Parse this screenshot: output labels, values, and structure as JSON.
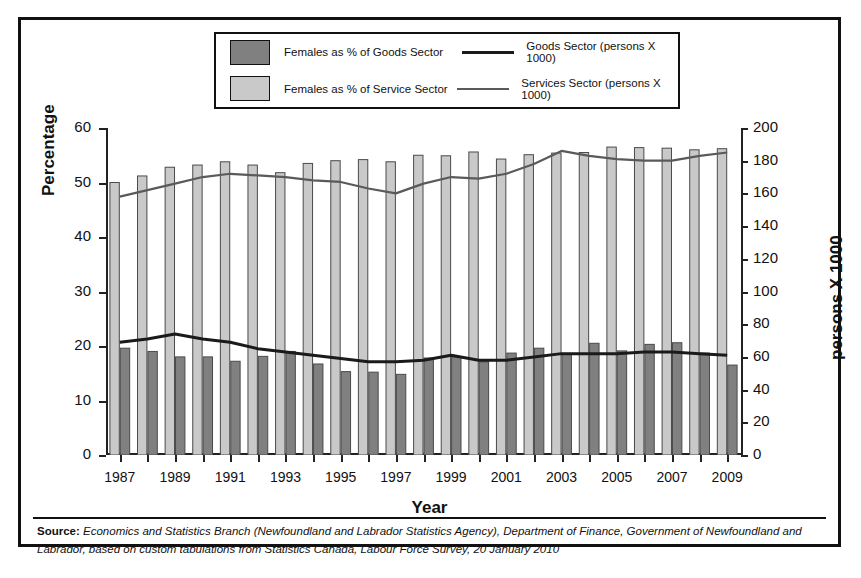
{
  "legend": {
    "items": [
      {
        "type": "swatch",
        "name": "goods-bar-swatch",
        "color": "#808080",
        "label": "Females as % of Goods Sector"
      },
      {
        "type": "line",
        "name": "goods-line-swatch",
        "color": "#1a1a1a",
        "width": 3,
        "label": "Goods Sector (persons X 1000)"
      },
      {
        "type": "swatch",
        "name": "service-bar-swatch",
        "color": "#c9c9c9",
        "label": "Females as % of Service Sector"
      },
      {
        "type": "line",
        "name": "service-line-swatch",
        "color": "#5a5a5a",
        "width": 2,
        "label": "Services Sector (persons X 1000)"
      }
    ]
  },
  "axes": {
    "y_left_title": "Percentage",
    "y_right_title": "persons X 1000",
    "x_title": "Year",
    "y_left_ticks": [
      "0",
      "10",
      "20",
      "30",
      "40",
      "50",
      "60"
    ],
    "y_right_ticks": [
      "0",
      "20",
      "40",
      "60",
      "80",
      "100",
      "120",
      "140",
      "160",
      "180",
      "200"
    ],
    "x_ticks": [
      "1987",
      "",
      "1989",
      "",
      "1991",
      "",
      "1993",
      "",
      "1995",
      "",
      "1997",
      "",
      "1999",
      "",
      "2001",
      "",
      "2003",
      "",
      "2005",
      "",
      "2007",
      "",
      "2009"
    ]
  },
  "source": {
    "prefix": "Source:",
    "text": " Economics and Statistics Branch (Newfoundland and Labrador Statistics Agency), Department of Finance, Government of Newfoundland and Labrador, based on custom tabulations from Statistics Canada, Labour Force Survey, 20 January 2010"
  },
  "chart_data": {
    "type": "bar",
    "title": "",
    "xlabel": "Year",
    "ylabel": "Percentage",
    "y2label": "persons X 1000",
    "ylim": [
      0,
      60
    ],
    "y2lim": [
      0,
      200
    ],
    "grid": false,
    "legend_position": "top",
    "categories": [
      1987,
      1988,
      1989,
      1990,
      1991,
      1992,
      1993,
      1994,
      1995,
      1996,
      1997,
      1998,
      1999,
      2000,
      2001,
      2002,
      2003,
      2004,
      2005,
      2006,
      2007,
      2008,
      2009
    ],
    "series": [
      {
        "name": "Females as % of Service Sector",
        "type": "bar",
        "axis": "left",
        "color": "#c9c9c9",
        "values": [
          50.0,
          51.2,
          52.8,
          53.2,
          53.8,
          53.2,
          51.8,
          53.5,
          54.0,
          54.2,
          53.8,
          55.0,
          54.9,
          55.6,
          54.3,
          55.1,
          55.4,
          55.5,
          56.5,
          56.4,
          56.3,
          56.0,
          56.2
        ]
      },
      {
        "name": "Females as % of Goods Sector",
        "type": "bar",
        "axis": "left",
        "color": "#808080",
        "values": [
          19.6,
          19.0,
          18.0,
          18.0,
          17.2,
          18.1,
          19.0,
          16.7,
          15.3,
          15.2,
          14.8,
          17.8,
          18.0,
          17.1,
          18.7,
          19.6,
          18.5,
          20.5,
          19.1,
          20.3,
          20.6,
          18.7,
          16.5
        ]
      },
      {
        "name": "Goods Sector (persons X 1000)",
        "type": "line",
        "axis": "right",
        "color": "#1a1a1a",
        "values": [
          69,
          71,
          74,
          71,
          69,
          65,
          63,
          61,
          59,
          57,
          57,
          58,
          61,
          58,
          58,
          60,
          62,
          62,
          62,
          63,
          63,
          62,
          61
        ]
      },
      {
        "name": "Services Sector (persons X 1000)",
        "type": "line",
        "axis": "right",
        "color": "#5a5a5a",
        "values": [
          158,
          162,
          166,
          170,
          172,
          171,
          170,
          168,
          167,
          163,
          160,
          166,
          170,
          169,
          172,
          178,
          186,
          183,
          181,
          180,
          180,
          183,
          185
        ]
      }
    ]
  }
}
